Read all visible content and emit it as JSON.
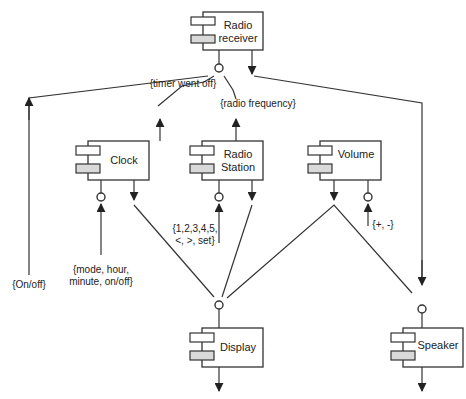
{
  "diagram": {
    "type": "UML component diagram",
    "components": [
      {
        "id": "radio_receiver",
        "label_lines": [
          "Radio",
          "receiver"
        ]
      },
      {
        "id": "clock",
        "label_lines": [
          "Clock"
        ]
      },
      {
        "id": "radio_station",
        "label_lines": [
          "Radio",
          "Station"
        ]
      },
      {
        "id": "volume",
        "label_lines": [
          "Volume"
        ]
      },
      {
        "id": "display",
        "label_lines": [
          "Display"
        ]
      },
      {
        "id": "speaker",
        "label_lines": [
          "Speaker"
        ]
      }
    ],
    "annotations": {
      "timer": "{timer went off}",
      "radio_frequency": "{radio frequency}",
      "on_off": "{On/off}",
      "clock_inputs_1": "{mode, hour,",
      "clock_inputs_2": "minute, on/off}",
      "station_inputs_1": "{1,2,3,4,5,",
      "station_inputs_2": "<, >, set}",
      "volume_inputs": "{+, -}"
    },
    "colors": {
      "line": "#333333",
      "port_fill_top": "#ffffff",
      "port_fill_bottom": "#d9d9d9",
      "background": "#ffffff"
    }
  }
}
